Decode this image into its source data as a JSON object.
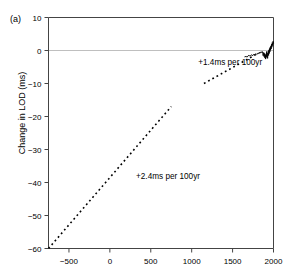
{
  "figure": {
    "panel_label": "(a)",
    "background_color": "#ffffff",
    "frame_color": "#444444",
    "zero_line_color": "#bfbfbf",
    "data_line_color": "#000000",
    "trend_line_color": "#000000"
  },
  "chart_data": {
    "type": "line",
    "title": "",
    "subtitle": "",
    "panel_label": "(a)",
    "xlabel": "",
    "ylabel": "Change in LOD (ms)",
    "xlim": [
      -750,
      2000
    ],
    "ylim": [
      -60,
      10
    ],
    "xticks": [
      -500,
      0,
      500,
      1000,
      1500,
      2000
    ],
    "xticklabels": [
      "−500",
      "0",
      "500",
      "1000",
      "1500",
      "2000"
    ],
    "yticks": [
      10,
      0,
      -10,
      -20,
      -30,
      -40,
      -50,
      -60
    ],
    "yticklabels": [
      "10",
      "0",
      "−10",
      "−20",
      "−30",
      "−40",
      "−50",
      "−60"
    ],
    "grid": false,
    "legend": "none",
    "reference_lines": [
      {
        "name": "zero-line",
        "orientation": "horizontal",
        "y": 0,
        "color": "#bfbfbf",
        "style": "solid"
      }
    ],
    "series": [
      {
        "name": "long-term-trend",
        "label": "+2.4ms per 100yr",
        "style": "dashed",
        "color": "#000000",
        "slope_ms_per_100yr": 2.4,
        "x": [
          -750,
          750
        ],
        "y": [
          -60,
          -17
        ]
      },
      {
        "name": "recent-trend",
        "label": "+1.4ms per 100yr",
        "style": "dashed",
        "color": "#000000",
        "slope_ms_per_100yr": 1.4,
        "x": [
          1150,
          1800
        ],
        "y": [
          -10,
          -1
        ]
      },
      {
        "name": "observed-lod",
        "label": "",
        "style": "solid",
        "color": "#000000",
        "x": [
          1650,
          1665,
          1678,
          1690,
          1700,
          1710,
          1722,
          1735,
          1745,
          1755,
          1768,
          1780,
          1790,
          1800,
          1810,
          1818,
          1825,
          1832,
          1840,
          1848,
          1855,
          1862,
          1868,
          1874,
          1880,
          1886,
          1890,
          1895,
          1900,
          1904,
          1908,
          1912,
          1916,
          1920,
          1924,
          1928,
          1932,
          1936,
          1940,
          1944,
          1948,
          1952,
          1956,
          1960,
          1964,
          1968,
          1972,
          1976,
          1980,
          1985,
          1990,
          1995,
          2000
        ],
        "y": [
          -1.9,
          -1.8,
          -2.0,
          -1.6,
          -1.4,
          -1.7,
          -1.5,
          -1.3,
          -1.6,
          -1.2,
          -1.3,
          -1.0,
          -1.2,
          -0.9,
          -1.1,
          -0.7,
          -0.9,
          -0.5,
          -0.8,
          -0.4,
          -0.6,
          -0.3,
          -0.9,
          -1.6,
          -0.6,
          -1.9,
          -0.9,
          -2.3,
          -1.4,
          -2.6,
          -1.0,
          -2.1,
          -0.3,
          -1.7,
          -0.8,
          -2.4,
          -1.2,
          -0.2,
          -1.5,
          0.2,
          -0.9,
          0.6,
          -0.4,
          1.0,
          0.1,
          1.4,
          0.5,
          1.9,
          1.0,
          2.4,
          1.5,
          2.8,
          2.2
        ]
      }
    ],
    "annotations": [
      {
        "name": "annotation-recent-trend",
        "text": "+1.4ms per 100yr",
        "x": 1080,
        "y": -4.3
      },
      {
        "name": "annotation-long-trend",
        "text": "+2.4ms per 100yr",
        "x": 320,
        "y": -38.8
      }
    ]
  }
}
